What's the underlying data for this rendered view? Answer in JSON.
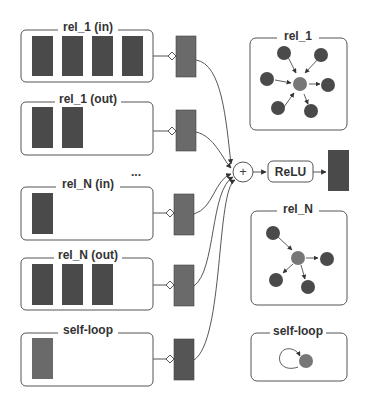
{
  "colors": {
    "background": "#ffffff",
    "stroke": "#555555",
    "feature_dark": "#4a4a4a",
    "feature_mid": "#6a6a6a",
    "node_dark": "#4a4a4a",
    "node_center": "#777777",
    "text": "#333333"
  },
  "left_groups": [
    {
      "label": "rel_1 (in)",
      "feature_count": 4
    },
    {
      "label": "rel_1 (out)",
      "feature_count": 2
    },
    {
      "label": "rel_N (in)",
      "feature_count": 1
    },
    {
      "label": "rel_N (out)",
      "feature_count": 3
    },
    {
      "label": "self-loop",
      "feature_count": 1
    }
  ],
  "ellipsis": "...",
  "aggregation": {
    "symbol": "+"
  },
  "activation": {
    "label": "ReLU"
  },
  "right_panels": [
    {
      "label": "rel_1",
      "type": "star-graph",
      "incoming": 4,
      "outgoing": 2
    },
    {
      "label": "rel_N",
      "type": "star-graph",
      "incoming": 1,
      "outgoing": 3
    },
    {
      "label": "self-loop",
      "type": "self-loop"
    }
  ]
}
